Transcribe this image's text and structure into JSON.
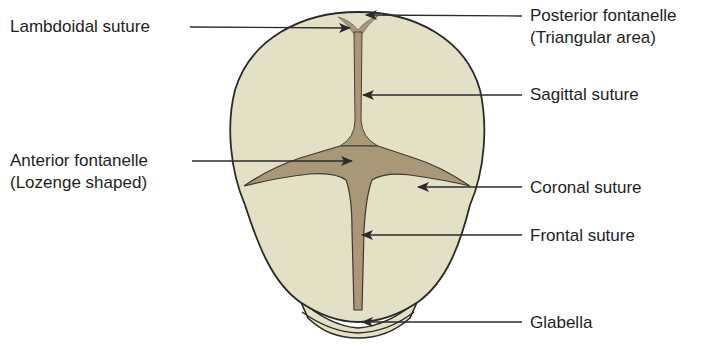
{
  "diagram": {
    "colors": {
      "bone": "#e3e0c6",
      "suture": "#a89878",
      "outline": "#2a2a26",
      "leader": "#2b2b2b",
      "text": "#1e1e1e"
    },
    "labels": {
      "lambdoidal": "Lambdoidal suture",
      "anterior_line1": "Anterior fontanelle",
      "anterior_line2": "(Lozenge shaped)",
      "posterior_line1": "Posterior fontanelle",
      "posterior_line2": "(Triangular area)",
      "sagittal": "Sagittal suture",
      "coronal": "Coronal suture",
      "frontal": "Frontal suture",
      "glabella": "Glabella"
    }
  }
}
